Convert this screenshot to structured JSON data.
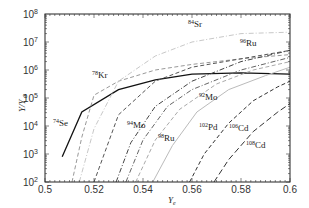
{
  "chart_data": {
    "type": "line",
    "title": "",
    "xlabel": "Y_e",
    "ylabel": "Y/Y_⊙",
    "xlim": [
      0.5,
      0.6
    ],
    "ylim": [
      100,
      100000000
    ],
    "yscale": "log",
    "x_ticks": [
      "0.5",
      "0.52",
      "0.54",
      "0.56",
      "0.58",
      "0.6"
    ],
    "y_ticks": [
      "10^2",
      "10^3",
      "10^4",
      "10^5",
      "10^6",
      "10^7",
      "10^8"
    ],
    "grid": false,
    "legend": "inline labels",
    "series": [
      {
        "name": "74Se",
        "style": "solid",
        "color": "#111111",
        "x": [
          0.507,
          0.515,
          0.53,
          0.545,
          0.56,
          0.58,
          0.6
        ],
        "log10y": [
          2.9,
          4.5,
          5.3,
          5.65,
          5.85,
          5.9,
          5.85
        ]
      },
      {
        "name": "78Kr",
        "style": "dashed",
        "color": "#999999",
        "x": [
          0.511,
          0.515,
          0.52,
          0.53,
          0.545,
          0.56,
          0.58,
          0.6
        ],
        "log10y": [
          2.0,
          3.6,
          5.1,
          5.6,
          6.0,
          6.2,
          6.4,
          6.55
        ]
      },
      {
        "name": "84Sr",
        "style": "dashdot",
        "color": "#c8c8c8",
        "x": [
          0.514,
          0.52,
          0.53,
          0.545,
          0.56,
          0.58,
          0.6
        ],
        "log10y": [
          2.0,
          3.9,
          5.6,
          6.5,
          7.0,
          7.3,
          7.35
        ]
      },
      {
        "name": "92Mo",
        "style": "dashdot",
        "color": "#444444",
        "x": [
          0.529,
          0.535,
          0.545,
          0.56,
          0.58,
          0.6
        ],
        "log10y": [
          2.0,
          3.4,
          4.7,
          5.6,
          6.3,
          6.7
        ]
      },
      {
        "name": "94Mo",
        "style": "dashdot",
        "color": "#666666",
        "x": [
          0.533,
          0.54,
          0.55,
          0.56,
          0.58,
          0.6
        ],
        "log10y": [
          2.0,
          3.5,
          4.7,
          5.3,
          6.0,
          6.45
        ]
      },
      {
        "name": "96Ru",
        "style": "dashed",
        "color": "#555555",
        "x": [
          0.52,
          0.53,
          0.545,
          0.56,
          0.58,
          0.6
        ],
        "log10y": [
          2.0,
          4.4,
          5.6,
          6.1,
          6.4,
          6.7
        ]
      },
      {
        "name": "98Ru",
        "style": "dashed",
        "color": "#aaaaaa",
        "x": [
          0.537,
          0.545,
          0.555,
          0.57,
          0.585,
          0.6
        ],
        "log10y": [
          2.0,
          3.5,
          4.6,
          5.5,
          6.0,
          6.3
        ]
      },
      {
        "name": "102Pd",
        "style": "solid",
        "color": "#bbbbbb",
        "x": [
          0.544,
          0.552,
          0.562,
          0.575,
          0.59,
          0.6
        ],
        "log10y": [
          2.0,
          3.3,
          4.5,
          5.3,
          5.8,
          6.1
        ]
      },
      {
        "name": "106Cd",
        "style": "dashed",
        "color": "#333333",
        "x": [
          0.559,
          0.565,
          0.575,
          0.585,
          0.595,
          0.6
        ],
        "log10y": [
          2.0,
          3.0,
          4.1,
          4.9,
          5.4,
          5.6
        ]
      },
      {
        "name": "108Cd",
        "style": "longdash",
        "color": "#333333",
        "x": [
          0.569,
          0.575,
          0.585,
          0.595,
          0.6
        ],
        "log10y": [
          2.0,
          2.8,
          3.8,
          4.5,
          4.8
        ]
      }
    ],
    "annotations": [
      {
        "text": "74Se",
        "mass": "74",
        "el": "Se",
        "x": 53,
        "y": 126
      },
      {
        "text": "78Kr",
        "mass": "78",
        "el": "Kr",
        "x": 92,
        "y": 78
      },
      {
        "text": "84Sr",
        "mass": "84",
        "el": "Sr",
        "x": 188,
        "y": 27
      },
      {
        "text": "96Ru",
        "mass": "96",
        "el": "Ru",
        "x": 240,
        "y": 46
      },
      {
        "text": "92Mo",
        "mass": "92",
        "el": "Mo",
        "x": 199,
        "y": 100
      },
      {
        "text": "94Mo",
        "mass": "94",
        "el": "Mo",
        "x": 127,
        "y": 128
      },
      {
        "text": "98Ru",
        "mass": "98",
        "el": "Ru",
        "x": 158,
        "y": 141
      },
      {
        "text": "102Pd",
        "mass": "102",
        "el": "Pd",
        "x": 199,
        "y": 130
      },
      {
        "text": "106Cd",
        "mass": "106",
        "el": "Cd",
        "x": 229,
        "y": 131
      },
      {
        "text": "108Cd",
        "mass": "108",
        "el": "Cd",
        "x": 246,
        "y": 148
      }
    ]
  }
}
